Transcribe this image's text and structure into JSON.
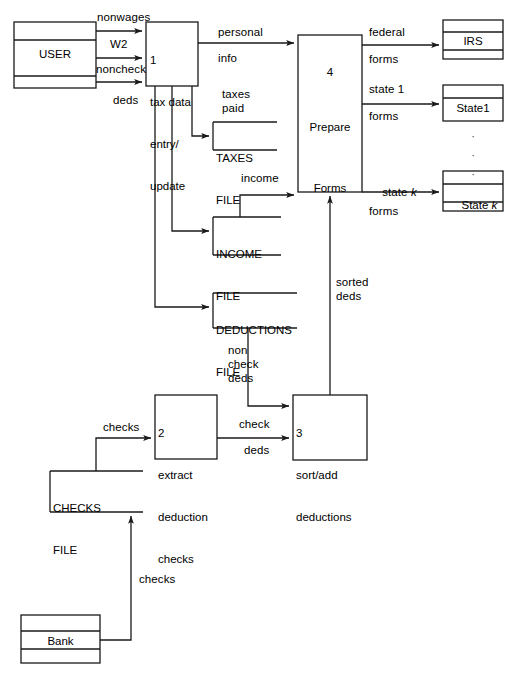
{
  "diagram": {
    "type": "data-flow-diagram",
    "stroke_color": "#1a1a1a",
    "background_color": "#ffffff"
  },
  "external_entities": [
    {
      "id": "user",
      "name": "USER",
      "bands": 3
    },
    {
      "id": "irs",
      "name": "IRS",
      "bands": 3
    },
    {
      "id": "state1",
      "name": "State1",
      "bands": 2
    },
    {
      "id": "statek",
      "name": "State k",
      "bands": 3
    },
    {
      "id": "bank",
      "name": "Bank",
      "bands": 3
    }
  ],
  "processes": [
    {
      "id": "p1",
      "number": "1",
      "name_line1": "tax data",
      "name_line2": "entry/",
      "name_line3": "update"
    },
    {
      "id": "p2",
      "number": "2",
      "name_line1": "extract",
      "name_line2": "deduction",
      "name_line3": "checks"
    },
    {
      "id": "p3",
      "number": "3",
      "name_line1": "sort/add",
      "name_line2": "deductions",
      "name_line3": ""
    },
    {
      "id": "p4",
      "number": "4",
      "name_line1": "Prepare",
      "name_line2": "Forms",
      "name_line3": ""
    }
  ],
  "data_stores": [
    {
      "id": "taxes",
      "name_line1": "TAXES",
      "name_line2": "FILE"
    },
    {
      "id": "income",
      "name_line1": "INCOME",
      "name_line2": "FILE"
    },
    {
      "id": "deductions",
      "name_line1": "DEDUCTIONS",
      "name_line2": "FILE"
    },
    {
      "id": "checks",
      "name_line1": "CHECKS",
      "name_line2": "FILE"
    }
  ],
  "flows": [
    {
      "id": "f1",
      "label": "nonwages",
      "from": "user",
      "to": "p1"
    },
    {
      "id": "f2",
      "label": "W2",
      "from": "user",
      "to": "p1"
    },
    {
      "id": "f3",
      "label": "noncheck",
      "from": "user",
      "to": "p1"
    },
    {
      "id": "f4",
      "label": "deds",
      "from": "user",
      "to": "p1"
    },
    {
      "id": "f5",
      "label": "personal",
      "from": "p1",
      "to": "p4"
    },
    {
      "id": "f6",
      "label": "info",
      "from": "p1",
      "to": "p4"
    },
    {
      "id": "f7",
      "label": "taxes",
      "from": "p1",
      "to": "taxes"
    },
    {
      "id": "f8",
      "label": "paid",
      "from": "p1",
      "to": "taxes"
    },
    {
      "id": "f9",
      "label": "income",
      "from": "income",
      "to": "p4"
    },
    {
      "id": "f10",
      "label": "federal",
      "from": "p4",
      "to": "irs"
    },
    {
      "id": "f11",
      "label": "forms",
      "from": "p4",
      "to": "irs"
    },
    {
      "id": "f12",
      "label": "state 1",
      "from": "p4",
      "to": "state1"
    },
    {
      "id": "f13",
      "label": "forms",
      "from": "p4",
      "to": "state1"
    },
    {
      "id": "f14",
      "label": "state k",
      "from": "p4",
      "to": "statek",
      "italic_tail": "k"
    },
    {
      "id": "f15",
      "label": "forms",
      "from": "p4",
      "to": "statek"
    },
    {
      "id": "f16",
      "label": "sorted",
      "from": "p3",
      "to": "p4"
    },
    {
      "id": "f17",
      "label": "deds",
      "from": "p3",
      "to": "p4"
    },
    {
      "id": "f18",
      "label": "non",
      "from": "deductions",
      "to": "p3"
    },
    {
      "id": "f19",
      "label": "check",
      "from": "deductions",
      "to": "p3"
    },
    {
      "id": "f20",
      "label": "deds",
      "from": "deductions",
      "to": "p3"
    },
    {
      "id": "f21",
      "label": "check",
      "from": "p2",
      "to": "p3"
    },
    {
      "id": "f22",
      "label": "deds",
      "from": "p2",
      "to": "p3"
    },
    {
      "id": "f23",
      "label": "checks",
      "from": "checks",
      "to": "p2"
    },
    {
      "id": "f24",
      "label": "checks",
      "from": "bank",
      "to": "checks"
    }
  ],
  "ellipsis": {
    "glyph": "·"
  },
  "caption": {
    "text": ""
  }
}
